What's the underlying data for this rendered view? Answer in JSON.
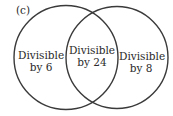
{
  "diagram": {
    "panel_label": "(c)",
    "type": "venn",
    "sets": [
      {
        "id": "A",
        "line1": "Divisible",
        "line2": "by 6"
      },
      {
        "id": "B",
        "line1": "Divisible",
        "line2": "by 8"
      }
    ],
    "intersection": {
      "line1": "Divisible",
      "line2": "by 24"
    },
    "colors": {
      "stroke": "#3a3a3a",
      "text": "#2a2a2a",
      "background": "#ffffff"
    }
  }
}
